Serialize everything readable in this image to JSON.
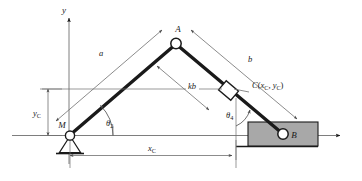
{
  "figure": {
    "stroke_color": "#1a1a1a",
    "thin_line_color": "#6f6f6f",
    "block_fill": "#a8a8a8",
    "joint_fill": "#ffffff",
    "background": "#ffffff"
  },
  "axes": {
    "y_label": "y",
    "x_label": "",
    "origin_label": ""
  },
  "points": {
    "A": {
      "label": "A",
      "kind": "pin-joint"
    },
    "B": {
      "label": "B",
      "kind": "pin-joint-in-slider"
    },
    "M": {
      "label": "M",
      "kind": "ground-pivot"
    },
    "C": {
      "label": "C",
      "coord_open": "(",
      "coord_x": "x",
      "coord_x_sub": "C",
      "coord_sep": ", ",
      "coord_y": "y",
      "coord_y_sub": "C",
      "coord_close": ")",
      "kind": "sliding-block"
    }
  },
  "links": {
    "a": {
      "label": "a",
      "description": "link from M to A"
    },
    "b": {
      "label": "b",
      "description": "link from A to B"
    },
    "kb": {
      "label_k": "k",
      "label_b": "b",
      "description": "partial length kb from A to C along link b"
    }
  },
  "angles": {
    "theta2": {
      "glyph": "θ",
      "sub": "2",
      "description": "angle of link a at M from x-axis"
    },
    "theta4": {
      "glyph": "θ",
      "sub": "4",
      "description": "angle of link b at B from vertical"
    }
  },
  "dimensions": {
    "x_C": {
      "glyph": "x",
      "sub": "C",
      "description": "horizontal distance from M to C"
    },
    "y_C": {
      "glyph": "y",
      "sub": "C",
      "description": "vertical distance from x-axis up to C level"
    }
  }
}
